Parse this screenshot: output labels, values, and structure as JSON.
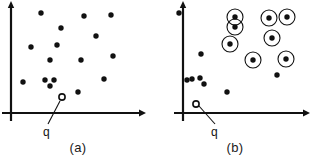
{
  "figure": {
    "background_color": "#ffffff",
    "ink_color": "#111111",
    "width": 313,
    "height": 163
  },
  "chart_data": {
    "type": "scatter",
    "xlabel": "",
    "ylabel": "",
    "grid": false,
    "legend": "none",
    "panels": [
      {
        "id": "a",
        "caption": "(a)",
        "axes": {
          "origin_x": 11,
          "origin_y": 113,
          "x_axis_end": 144,
          "y_axis_top": 2,
          "y_axis_bottom": 121,
          "arrowheads": [
            "x-right",
            "y-up"
          ]
        },
        "query_point": {
          "label": "q",
          "style": "open-circle",
          "x": 62,
          "y": 97,
          "label_x": 43,
          "label_y": 125,
          "leader_from": [
            60,
            101
          ],
          "leader_to": [
            48,
            124
          ]
        },
        "points": [
          {
            "x": 41,
            "y": 13,
            "circled": false
          },
          {
            "x": 84,
            "y": 16,
            "circled": false
          },
          {
            "x": 111,
            "y": 15,
            "circled": false
          },
          {
            "x": 61,
            "y": 28,
            "circled": false
          },
          {
            "x": 96,
            "y": 36,
            "circled": false
          },
          {
            "x": 31,
            "y": 47,
            "circled": false
          },
          {
            "x": 57,
            "y": 45,
            "circled": false
          },
          {
            "x": 50,
            "y": 60,
            "circled": false
          },
          {
            "x": 81,
            "y": 60,
            "circled": false
          },
          {
            "x": 113,
            "y": 56,
            "circled": false
          },
          {
            "x": 23,
            "y": 82,
            "circled": false
          },
          {
            "x": 45,
            "y": 80,
            "circled": false
          },
          {
            "x": 54,
            "y": 80,
            "circled": false
          },
          {
            "x": 50,
            "y": 86,
            "circled": false
          },
          {
            "x": 104,
            "y": 79,
            "circled": false
          },
          {
            "x": 78,
            "y": 92,
            "circled": false
          }
        ],
        "point_count": 16,
        "circled_count": 0
      },
      {
        "id": "b",
        "caption": "(b)",
        "axes": {
          "origin_x": 26,
          "origin_y": 113,
          "x_axis_end": 151,
          "y_axis_top": 2,
          "y_axis_bottom": 121,
          "arrowheads": [
            "x-right",
            "y-up"
          ]
        },
        "query_point": {
          "label": "q",
          "style": "open-circle",
          "x": 39,
          "y": 104,
          "label_x": 54,
          "label_y": 125,
          "leader_from": [
            42,
            106
          ],
          "leader_to": [
            58,
            124
          ]
        },
        "points": [
          {
            "x": 22,
            "y": 13,
            "circled": false
          },
          {
            "x": 78,
            "y": 17,
            "circled": true
          },
          {
            "x": 130,
            "y": 17,
            "circled": true
          },
          {
            "x": 112,
            "y": 18,
            "circled": true
          },
          {
            "x": 78,
            "y": 27,
            "circled": true
          },
          {
            "x": 73,
            "y": 44,
            "circled": true
          },
          {
            "x": 115,
            "y": 38,
            "circled": true
          },
          {
            "x": -6,
            "y": 47,
            "circled": false
          },
          {
            "x": 96,
            "y": 60,
            "circled": true
          },
          {
            "x": 129,
            "y": 59,
            "circled": true
          },
          {
            "x": 44,
            "y": 54,
            "circled": false
          },
          {
            "x": 120,
            "y": 75,
            "circled": false
          },
          {
            "x": 30,
            "y": 80,
            "circled": false
          },
          {
            "x": 35,
            "y": 79,
            "circled": false
          },
          {
            "x": 43,
            "y": 78,
            "circled": false
          },
          {
            "x": 47,
            "y": 84,
            "circled": false
          },
          {
            "x": 70,
            "y": 92,
            "circled": false
          }
        ],
        "point_count": 17,
        "circled_count": 8,
        "circle_radius": 8
      }
    ]
  }
}
